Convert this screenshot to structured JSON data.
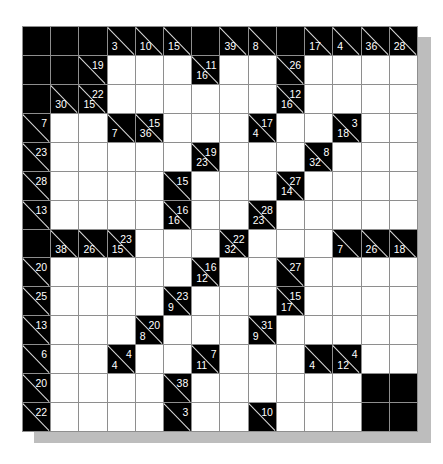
{
  "puzzle": {
    "type": "kakuro",
    "rows": 14,
    "cols": 14,
    "colors": {
      "black": "#000000",
      "white": "#ffffff",
      "grid_line": "#8e8e8e",
      "shadow": "#bdbdbd"
    },
    "grid": [
      [
        {
          "t": "b"
        },
        {
          "t": "b"
        },
        {
          "t": "b"
        },
        {
          "t": "c",
          "d": "3"
        },
        {
          "t": "c",
          "d": "10"
        },
        {
          "t": "c",
          "d": "15"
        },
        {
          "t": "b"
        },
        {
          "t": "c",
          "d": "39"
        },
        {
          "t": "c",
          "d": "8"
        },
        {
          "t": "b"
        },
        {
          "t": "c",
          "d": "17"
        },
        {
          "t": "c",
          "d": "4"
        },
        {
          "t": "c",
          "d": "36"
        },
        {
          "t": "c",
          "d": "28"
        }
      ],
      [
        {
          "t": "b"
        },
        {
          "t": "b"
        },
        {
          "t": "c",
          "r": "19"
        },
        {
          "t": "w"
        },
        {
          "t": "w"
        },
        {
          "t": "w"
        },
        {
          "t": "c",
          "r": "11",
          "d": "16"
        },
        {
          "t": "w"
        },
        {
          "t": "w"
        },
        {
          "t": "c",
          "r": "26"
        },
        {
          "t": "w"
        },
        {
          "t": "w"
        },
        {
          "t": "w"
        },
        {
          "t": "w"
        }
      ],
      [
        {
          "t": "b"
        },
        {
          "t": "c",
          "d": "30"
        },
        {
          "t": "c",
          "r": "22",
          "d": "15"
        },
        {
          "t": "w"
        },
        {
          "t": "w"
        },
        {
          "t": "w"
        },
        {
          "t": "w"
        },
        {
          "t": "w"
        },
        {
          "t": "w"
        },
        {
          "t": "c",
          "r": "12",
          "d": "16"
        },
        {
          "t": "w"
        },
        {
          "t": "w"
        },
        {
          "t": "w"
        },
        {
          "t": "w"
        }
      ],
      [
        {
          "t": "c",
          "r": "7"
        },
        {
          "t": "w"
        },
        {
          "t": "w"
        },
        {
          "t": "c",
          "d": "7"
        },
        {
          "t": "c",
          "r": "15",
          "d": "36"
        },
        {
          "t": "w"
        },
        {
          "t": "w"
        },
        {
          "t": "w"
        },
        {
          "t": "c",
          "r": "17",
          "d": "4"
        },
        {
          "t": "w"
        },
        {
          "t": "w"
        },
        {
          "t": "c",
          "r": "3",
          "d": "18"
        },
        {
          "t": "w"
        },
        {
          "t": "w"
        }
      ],
      [
        {
          "t": "c",
          "r": "23"
        },
        {
          "t": "w"
        },
        {
          "t": "w"
        },
        {
          "t": "w"
        },
        {
          "t": "w"
        },
        {
          "t": "w"
        },
        {
          "t": "c",
          "r": "19",
          "d": "23"
        },
        {
          "t": "w"
        },
        {
          "t": "w"
        },
        {
          "t": "w"
        },
        {
          "t": "c",
          "r": "8",
          "d": "32"
        },
        {
          "t": "w"
        },
        {
          "t": "w"
        },
        {
          "t": "w"
        }
      ],
      [
        {
          "t": "c",
          "r": "28"
        },
        {
          "t": "w"
        },
        {
          "t": "w"
        },
        {
          "t": "w"
        },
        {
          "t": "w"
        },
        {
          "t": "c",
          "r": "15"
        },
        {
          "t": "w"
        },
        {
          "t": "w"
        },
        {
          "t": "w"
        },
        {
          "t": "c",
          "r": "27",
          "d": "14"
        },
        {
          "t": "w"
        },
        {
          "t": "w"
        },
        {
          "t": "w"
        },
        {
          "t": "w"
        }
      ],
      [
        {
          "t": "c",
          "r": "13"
        },
        {
          "t": "w"
        },
        {
          "t": "w"
        },
        {
          "t": "w"
        },
        {
          "t": "w"
        },
        {
          "t": "c",
          "r": "16",
          "d": "16"
        },
        {
          "t": "w"
        },
        {
          "t": "w"
        },
        {
          "t": "c",
          "r": "28",
          "d": "23"
        },
        {
          "t": "w"
        },
        {
          "t": "w"
        },
        {
          "t": "w"
        },
        {
          "t": "w"
        },
        {
          "t": "w"
        }
      ],
      [
        {
          "t": "b"
        },
        {
          "t": "c",
          "d": "38"
        },
        {
          "t": "c",
          "d": "26"
        },
        {
          "t": "c",
          "r": "23",
          "d": "15"
        },
        {
          "t": "w"
        },
        {
          "t": "w"
        },
        {
          "t": "w"
        },
        {
          "t": "c",
          "r": "22",
          "d": "32"
        },
        {
          "t": "w"
        },
        {
          "t": "w"
        },
        {
          "t": "w"
        },
        {
          "t": "c",
          "d": "7"
        },
        {
          "t": "c",
          "d": "26"
        },
        {
          "t": "c",
          "d": "18"
        }
      ],
      [
        {
          "t": "c",
          "r": "20"
        },
        {
          "t": "w"
        },
        {
          "t": "w"
        },
        {
          "t": "w"
        },
        {
          "t": "w"
        },
        {
          "t": "w"
        },
        {
          "t": "c",
          "r": "16",
          "d": "12"
        },
        {
          "t": "w"
        },
        {
          "t": "w"
        },
        {
          "t": "c",
          "r": "27"
        },
        {
          "t": "w"
        },
        {
          "t": "w"
        },
        {
          "t": "w"
        },
        {
          "t": "w"
        }
      ],
      [
        {
          "t": "c",
          "r": "25"
        },
        {
          "t": "w"
        },
        {
          "t": "w"
        },
        {
          "t": "w"
        },
        {
          "t": "w"
        },
        {
          "t": "c",
          "r": "23",
          "d": "9"
        },
        {
          "t": "w"
        },
        {
          "t": "w"
        },
        {
          "t": "w"
        },
        {
          "t": "c",
          "r": "15",
          "d": "17"
        },
        {
          "t": "w"
        },
        {
          "t": "w"
        },
        {
          "t": "w"
        },
        {
          "t": "w"
        }
      ],
      [
        {
          "t": "c",
          "r": "13"
        },
        {
          "t": "w"
        },
        {
          "t": "w"
        },
        {
          "t": "w"
        },
        {
          "t": "c",
          "r": "20",
          "d": "8"
        },
        {
          "t": "w"
        },
        {
          "t": "w"
        },
        {
          "t": "w"
        },
        {
          "t": "c",
          "r": "31",
          "d": "9"
        },
        {
          "t": "w"
        },
        {
          "t": "w"
        },
        {
          "t": "w"
        },
        {
          "t": "w"
        },
        {
          "t": "w"
        }
      ],
      [
        {
          "t": "c",
          "r": "6"
        },
        {
          "t": "w"
        },
        {
          "t": "w"
        },
        {
          "t": "c",
          "r": "4",
          "d": "4"
        },
        {
          "t": "w"
        },
        {
          "t": "w"
        },
        {
          "t": "c",
          "r": "7",
          "d": "11"
        },
        {
          "t": "w"
        },
        {
          "t": "w"
        },
        {
          "t": "w"
        },
        {
          "t": "c",
          "d": "4"
        },
        {
          "t": "c",
          "r": "4",
          "d": "12"
        },
        {
          "t": "w"
        },
        {
          "t": "w"
        }
      ],
      [
        {
          "t": "c",
          "r": "20"
        },
        {
          "t": "w"
        },
        {
          "t": "w"
        },
        {
          "t": "w"
        },
        {
          "t": "w"
        },
        {
          "t": "c",
          "r": "38"
        },
        {
          "t": "w"
        },
        {
          "t": "w"
        },
        {
          "t": "w"
        },
        {
          "t": "w"
        },
        {
          "t": "w"
        },
        {
          "t": "w"
        },
        {
          "t": "b"
        },
        {
          "t": "b"
        }
      ],
      [
        {
          "t": "c",
          "r": "22"
        },
        {
          "t": "w"
        },
        {
          "t": "w"
        },
        {
          "t": "w"
        },
        {
          "t": "w"
        },
        {
          "t": "c",
          "r": "3"
        },
        {
          "t": "w"
        },
        {
          "t": "w"
        },
        {
          "t": "c",
          "r": "10"
        },
        {
          "t": "w"
        },
        {
          "t": "w"
        },
        {
          "t": "w"
        },
        {
          "t": "b"
        },
        {
          "t": "b"
        }
      ]
    ]
  }
}
